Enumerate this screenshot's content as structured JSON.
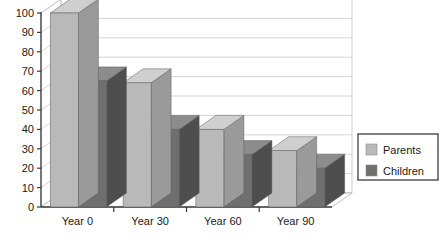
{
  "chart_data": {
    "type": "bar",
    "title": "",
    "subtitle": "",
    "xlabel": "",
    "ylabel": "",
    "categories": [
      "Year 0",
      "Year 30",
      "Year 60",
      "Year 90"
    ],
    "series": [
      {
        "name": "Parents",
        "values": [
          100,
          64,
          40,
          29
        ],
        "color": "#b9b9b9"
      },
      {
        "name": "Children",
        "values": [
          65,
          40,
          27,
          20
        ],
        "color": "#6f6f6f"
      }
    ],
    "ylim": [
      0,
      100
    ],
    "ytick_step": 10,
    "ytick_labels": [
      "0",
      "10",
      "20",
      "30",
      "40",
      "50",
      "60",
      "70",
      "80",
      "90",
      "100"
    ],
    "grid": true,
    "grid_axis": "y",
    "legend_position": "right",
    "three_d": true,
    "annotations": []
  },
  "legend": {
    "entries": [
      {
        "label": "Parents",
        "swatch_color": "#b9b9b9"
      },
      {
        "label": "Children",
        "swatch_color": "#6f6f6f"
      }
    ]
  },
  "style": {
    "background": "#ffffff",
    "wall_color": "#ffffff",
    "grid_color": "#c9c9c9",
    "axis_color": "#3a3a3a",
    "floor_color": "#fdfdfd",
    "parents_front": "#b9b9b9",
    "parents_top": "#cfcfcf",
    "parents_side": "#9a9a9a",
    "children_front": "#6f6f6f",
    "children_top": "#8c8c8c",
    "children_side": "#4e4e4e",
    "legend_border": "#4a4a4a",
    "text_color": "#1a1a1a"
  }
}
